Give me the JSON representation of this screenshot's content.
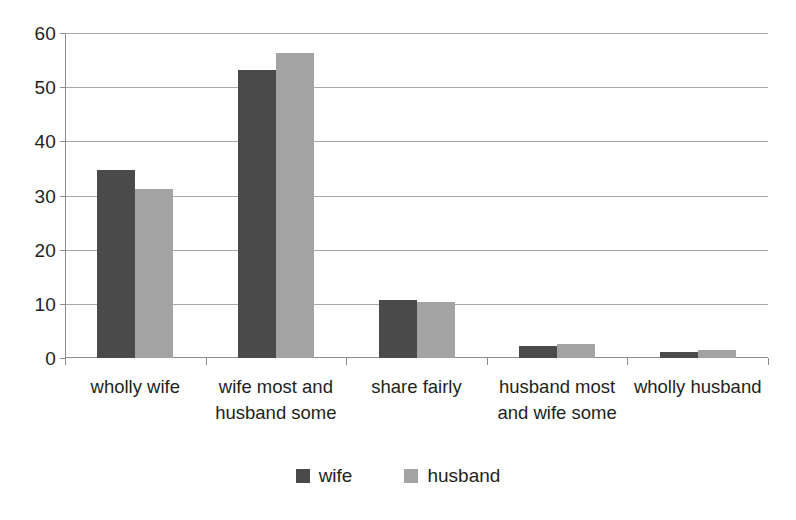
{
  "chart_data": {
    "type": "bar",
    "title": "",
    "subtitle": "",
    "xlabel": "",
    "ylabel": "",
    "ylim": [
      0,
      60
    ],
    "ytick_step": 10,
    "ytick_labels": [
      "60",
      "50",
      "40",
      "30",
      "20",
      "10",
      "0"
    ],
    "grid": true,
    "legend_position": "bottom-center",
    "categories": [
      "wholly wife",
      "wife most and husband some",
      "share fairly",
      "husband most and wife some",
      "wholly husband"
    ],
    "category_lines": [
      [
        "wholly wife"
      ],
      [
        "wife most and",
        "husband some"
      ],
      [
        "share fairly"
      ],
      [
        "husband most",
        "and wife some"
      ],
      [
        "wholly husband"
      ]
    ],
    "series": [
      {
        "name": "wife",
        "color": "#4a4a4a",
        "values": [
          34.7,
          53.2,
          10.8,
          2.2,
          1.1
        ]
      },
      {
        "name": "husband",
        "color": "#a3a3a3",
        "values": [
          31.2,
          56.3,
          10.4,
          2.5,
          1.4
        ]
      }
    ]
  },
  "legend": {
    "items": [
      {
        "label": "wife",
        "color": "#4a4a4a"
      },
      {
        "label": "husband",
        "color": "#a3a3a3"
      }
    ]
  },
  "axis": {
    "line_color": "#8d8d8d",
    "grid_color": "#a8a8a8",
    "text_color": "#231f20"
  }
}
